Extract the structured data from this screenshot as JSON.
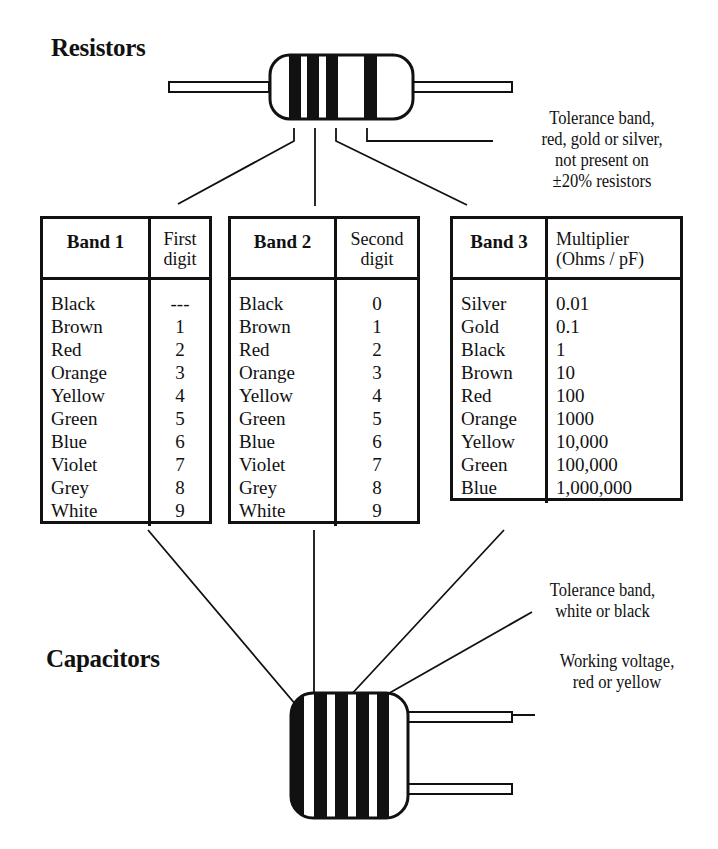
{
  "resistors_section": {
    "heading": "Resistors",
    "tolerance_note": [
      "Tolerance band,",
      "red, gold or silver,",
      "not present on",
      "±20% resistors"
    ]
  },
  "capacitors_section": {
    "heading": "Capacitors",
    "tolerance_note": [
      "Tolerance band,",
      "white or black"
    ],
    "voltage_note": [
      "Working voltage,",
      "red or yellow"
    ]
  },
  "tables": {
    "band1": {
      "header_a": "Band 1",
      "header_b": [
        "First",
        "digit"
      ],
      "rows": [
        {
          "color": "Black",
          "value": "---"
        },
        {
          "color": "Brown",
          "value": "1"
        },
        {
          "color": "Red",
          "value": "2"
        },
        {
          "color": "Orange",
          "value": "3"
        },
        {
          "color": "Yellow",
          "value": "4"
        },
        {
          "color": "Green",
          "value": "5"
        },
        {
          "color": "Blue",
          "value": "6"
        },
        {
          "color": "Violet",
          "value": "7"
        },
        {
          "color": "Grey",
          "value": "8"
        },
        {
          "color": "White",
          "value": "9"
        }
      ]
    },
    "band2": {
      "header_a": "Band 2",
      "header_b": [
        "Second",
        "digit"
      ],
      "rows": [
        {
          "color": "Black",
          "value": "0"
        },
        {
          "color": "Brown",
          "value": "1"
        },
        {
          "color": "Red",
          "value": "2"
        },
        {
          "color": "Orange",
          "value": "3"
        },
        {
          "color": "Yellow",
          "value": "4"
        },
        {
          "color": "Green",
          "value": "5"
        },
        {
          "color": "Blue",
          "value": "6"
        },
        {
          "color": "Violet",
          "value": "7"
        },
        {
          "color": "Grey",
          "value": "8"
        },
        {
          "color": "White",
          "value": "9"
        }
      ]
    },
    "band3": {
      "header_a": "Band 3",
      "header_b": [
        "Multiplier",
        "(Ohms / pF)"
      ],
      "rows": [
        {
          "color": "Silver",
          "value": "0.01"
        },
        {
          "color": "Gold",
          "value": "0.1"
        },
        {
          "color": "Black",
          "value": "1"
        },
        {
          "color": "Brown",
          "value": "10"
        },
        {
          "color": "Red",
          "value": "100"
        },
        {
          "color": "Orange",
          "value": "1000"
        },
        {
          "color": "Yellow",
          "value": "10,000"
        },
        {
          "color": "Green",
          "value": "100,000"
        },
        {
          "color": "Blue",
          "value": "1,000,000"
        }
      ]
    }
  },
  "colors": {
    "ink": "#111111",
    "background": "#ffffff"
  }
}
